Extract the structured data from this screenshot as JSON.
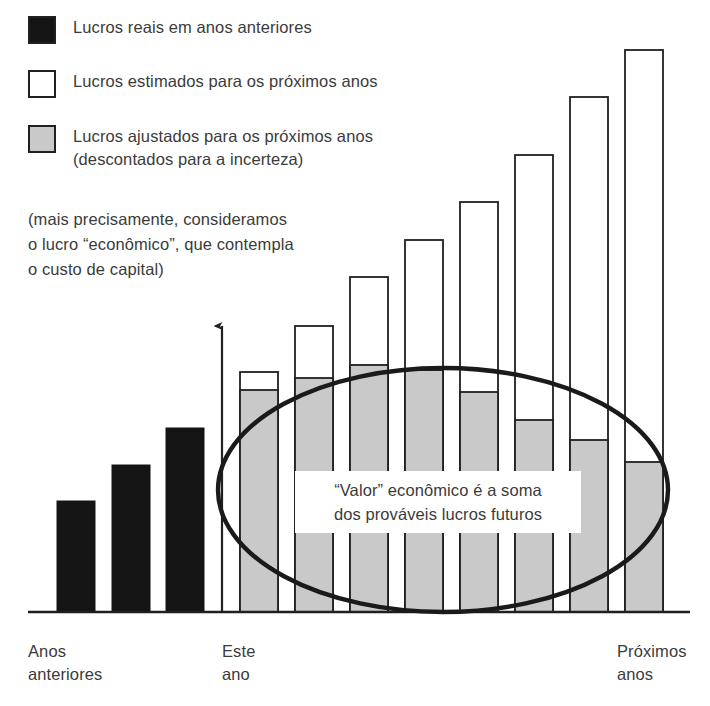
{
  "legend": {
    "items": [
      {
        "swatch": "black",
        "label": "Lucros reais em anos anteriores"
      },
      {
        "swatch": "white",
        "label": "Lucros estimados para os próximos anos"
      },
      {
        "swatch": "gray",
        "label": "Lucros ajustados para os próximos anos\n(descontados para a incerteza)"
      }
    ],
    "note": "(mais precisamente, consideramos\no lucro “econômico”, que contempla\no custo de capital)"
  },
  "annotation": {
    "text": "“Valor” econômico é a soma\ndos prováveis lucros futuros"
  },
  "axis": {
    "past_label": "Anos\nanteriores",
    "this_year_label": "Este\nano",
    "next_label": "Próximos\nanos"
  },
  "colors": {
    "past_bar": "#141414",
    "estimated_bar": "#ffffff",
    "adjusted_bar": "#c9c9c9",
    "outline": "#231f20",
    "text": "#3b3b3b",
    "background": "#ffffff"
  },
  "chart_data": {
    "type": "bar",
    "title": "",
    "xlabel": "",
    "ylabel": "",
    "grid": false,
    "legend_position": "top-left",
    "baseline_y": 612,
    "bar_width": 38,
    "axis_arrow_x": 222,
    "axis_arrow_top": 317,
    "axis_baseline_left": 28,
    "axis_baseline_right": 690,
    "categories": [
      "Ano -3",
      "Ano -2",
      "Ano -1",
      "Este ano",
      "Ano +1",
      "Ano +2",
      "Ano +3",
      "Ano +4",
      "Ano +5",
      "Ano +6",
      "Ano +7"
    ],
    "series": [
      {
        "name": "Lucros reais em anos anteriores",
        "kind": "past",
        "fill": "#141414",
        "bars": [
          {
            "x": 57,
            "height": 111
          },
          {
            "x": 112,
            "height": 147
          },
          {
            "x": 166,
            "height": 184
          }
        ]
      },
      {
        "name": "Lucros estimados para os próximos anos",
        "kind": "estimated",
        "fill": "#ffffff",
        "bars": [
          {
            "x": 240,
            "height": 240
          },
          {
            "x": 295,
            "height": 286
          },
          {
            "x": 350,
            "height": 335
          },
          {
            "x": 405,
            "height": 372
          },
          {
            "x": 460,
            "height": 410
          },
          {
            "x": 515,
            "height": 457
          },
          {
            "x": 570,
            "height": 515
          },
          {
            "x": 625,
            "height": 562
          }
        ]
      },
      {
        "name": "Lucros ajustados para os próximos anos",
        "kind": "adjusted",
        "fill": "#c9c9c9",
        "bars": [
          {
            "x": 240,
            "height": 222
          },
          {
            "x": 295,
            "height": 234
          },
          {
            "x": 350,
            "height": 247
          },
          {
            "x": 405,
            "height": 242
          },
          {
            "x": 460,
            "height": 220
          },
          {
            "x": 515,
            "height": 192
          },
          {
            "x": 570,
            "height": 172
          },
          {
            "x": 625,
            "height": 150
          }
        ]
      }
    ],
    "highlight_ellipse": {
      "cx": 443,
      "cy": 490,
      "rx": 225,
      "ry": 122
    }
  }
}
